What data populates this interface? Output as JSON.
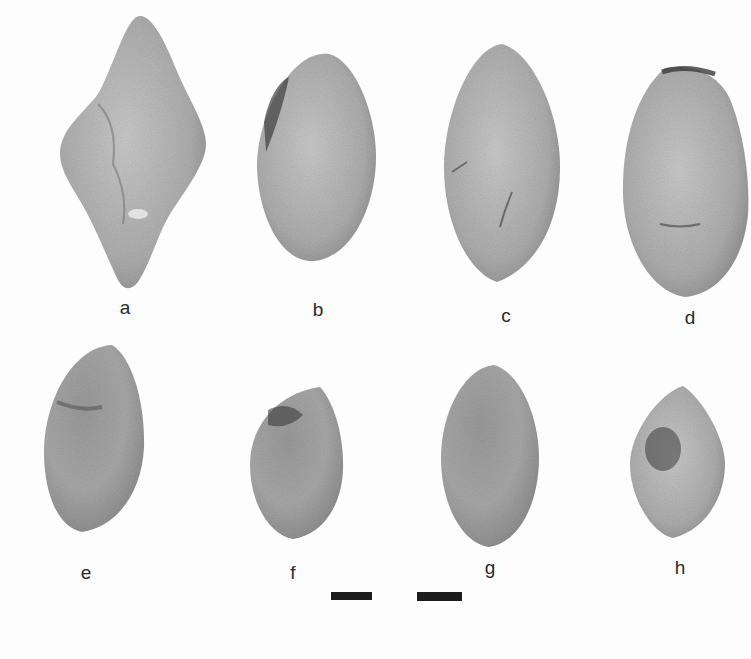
{
  "figure": {
    "specimens": [
      {
        "id": "a",
        "label": "a"
      },
      {
        "id": "b",
        "label": "b"
      },
      {
        "id": "c",
        "label": "c"
      },
      {
        "id": "d",
        "label": "d"
      },
      {
        "id": "e",
        "label": "e"
      },
      {
        "id": "f",
        "label": "f"
      },
      {
        "id": "g",
        "label": "g"
      },
      {
        "id": "h",
        "label": "h"
      }
    ],
    "scale_bars": 2,
    "colors": {
      "background": "#fdfdfd",
      "specimen_fill": "#b4b4b4",
      "specimen_dark": "#5a5a5a",
      "text": "#2a2a2a",
      "scale_bar": "#1c1c1c"
    }
  }
}
